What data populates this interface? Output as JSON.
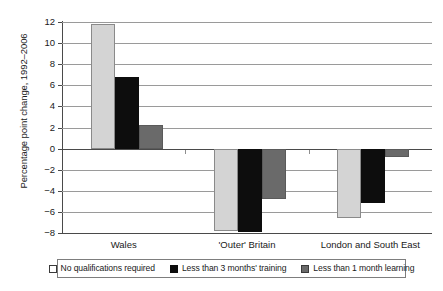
{
  "chart_data": {
    "type": "bar",
    "title": "",
    "subtitle": "",
    "xlabel": "",
    "ylabel": "Percentage point change, 1992–2006",
    "ylim": [
      -8,
      12
    ],
    "ytick_labels": [
      "12",
      "10",
      "8",
      "6",
      "4",
      "2",
      "0",
      "−2",
      "−4",
      "−6",
      "−8"
    ],
    "ytick_values": [
      12,
      10,
      8,
      6,
      4,
      2,
      0,
      -2,
      -4,
      -6,
      -8
    ],
    "grid": true,
    "legend_position": "bottom",
    "categories": [
      "Wales",
      "'Outer' Britain",
      "London and South East"
    ],
    "series": [
      {
        "name": "No qualifications required",
        "color": "#d4d4d4",
        "values": [
          11.8,
          -7.8,
          -6.6
        ]
      },
      {
        "name": "Less than 3 months' training",
        "color": "#0d0d0d",
        "values": [
          6.8,
          -7.9,
          -5.2
        ]
      },
      {
        "name": "Less than 1 month learning",
        "color": "#6a6a6a",
        "values": [
          2.2,
          -4.8,
          -0.8
        ]
      }
    ]
  },
  "axis": {
    "y_title": "Percentage point change, 1992–2006",
    "ticks": [
      {
        "label": "12"
      },
      {
        "label": "10"
      },
      {
        "label": "8"
      },
      {
        "label": "6"
      },
      {
        "label": "4"
      },
      {
        "label": "2"
      },
      {
        "label": "0"
      },
      {
        "label": "−2"
      },
      {
        "label": "−4"
      },
      {
        "label": "−6"
      },
      {
        "label": "−8"
      }
    ]
  },
  "categories": [
    {
      "label": "Wales"
    },
    {
      "label": "'Outer' Britain"
    },
    {
      "label": "London and South East"
    }
  ],
  "legend": {
    "items": [
      {
        "label": "No qualifications required",
        "swatch": "light-gray-swatch"
      },
      {
        "label": "Less than 3 months' training",
        "swatch": "black-swatch"
      },
      {
        "label": "Less than 1 month learning",
        "swatch": "dark-gray-swatch"
      }
    ]
  }
}
